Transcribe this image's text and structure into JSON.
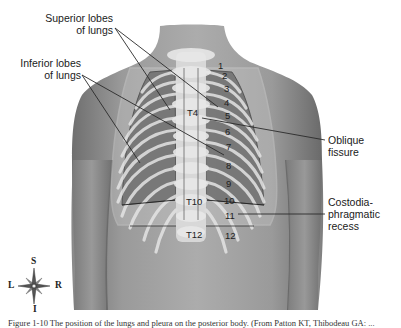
{
  "figure": {
    "labels": {
      "superior_lobes": "Superior lobes\nof lungs",
      "inferior_lobes": "Inferior lobes\nof lungs",
      "oblique_fissure": "Oblique\nfissure",
      "costodiaphragmatic_recess": "Costodia-\nphragmatic\nrecess"
    },
    "vertebra_labels": [
      "T4",
      "T10",
      "T12"
    ],
    "rib_numbers": [
      "1",
      "2",
      "3",
      "4",
      "5",
      "6",
      "7",
      "8",
      "9",
      "10",
      "11",
      "12"
    ],
    "compass": {
      "superior": "S",
      "inferior": "I",
      "left": "L",
      "right": "R"
    },
    "caption": "Figure 1-10  The position of the lungs and pleura on the posterior body. (From Patton KT, Thibodeau GA: ..."
  },
  "colors": {
    "skin": "#8f8f8f",
    "skin_light": "#a9a9a9",
    "lung": "#7a7a7a",
    "bone": "#d8d8d8",
    "leader_line": "#2a2a2a"
  }
}
